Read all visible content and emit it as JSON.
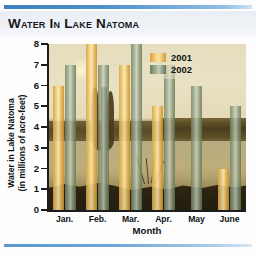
{
  "title": "Water In Lake Natoma",
  "axes": {
    "y_label_line1": "Water in Lake Natoma",
    "y_label_line2": "(in millions of acre-feet)",
    "x_label": "Month",
    "y_ticks": [
      "8",
      "7",
      "6",
      "5",
      "4",
      "3",
      "2",
      "1",
      "0"
    ]
  },
  "legend": {
    "items": [
      {
        "label": "2001",
        "color": "#e8b44c"
      },
      {
        "label": "2002",
        "color": "#8d9c80"
      }
    ]
  },
  "chart_data": {
    "type": "bar",
    "title": "Water In Lake Natoma",
    "subtitle": "",
    "xlabel": "Month",
    "ylabel": "Water in Lake Natoma (in millions of acre-feet)",
    "categories": [
      "Jan.",
      "Feb.",
      "Mar.",
      "Apr.",
      "May",
      "June"
    ],
    "series": [
      {
        "name": "2001",
        "color": "#e8b44c",
        "values": [
          6,
          8,
          7,
          5,
          0,
          2
        ]
      },
      {
        "name": "2002",
        "color": "#8d9c80",
        "values": [
          7,
          7,
          8,
          7,
          6,
          5
        ]
      }
    ],
    "ylim": [
      0,
      8
    ],
    "ytick_step": 1,
    "grid": false,
    "legend_position": "top-right"
  }
}
